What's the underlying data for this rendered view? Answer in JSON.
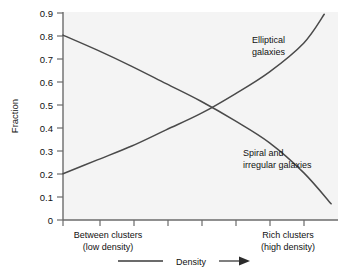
{
  "chart_data": {
    "type": "line",
    "title": "",
    "xlabel": "Density",
    "ylabel": "Fraction",
    "ylim": [
      0,
      0.9
    ],
    "xlim": [
      0,
      1
    ],
    "grid": false,
    "legend": "inline-annotations",
    "ytick_labels": [
      "0",
      "0.1",
      "0.2",
      "0.3",
      "0.4",
      "0.5",
      "0.6",
      "0.7",
      "0.8",
      "0.9"
    ],
    "ytick_values": [
      0,
      0.1,
      0.2,
      0.3,
      0.4,
      0.5,
      0.6,
      0.7,
      0.8,
      0.9
    ],
    "xtick_count": 8,
    "xtick_labels": [
      "",
      "",
      "",
      "",
      "",
      "",
      "",
      ""
    ],
    "x_category_left": "Between clusters",
    "x_category_left_sub": "(low density)",
    "x_category_right": "Rich clusters",
    "x_category_right_sub": "(high density)",
    "series": [
      {
        "name": "Elliptical galaxies",
        "label_line1": "Elliptical",
        "label_line2": "galaxies",
        "color": "#4a4a4a",
        "x": [
          0.0,
          0.125,
          0.25,
          0.375,
          0.5,
          0.625,
          0.75,
          0.875,
          0.95
        ],
        "values": [
          0.2,
          0.26,
          0.32,
          0.39,
          0.46,
          0.545,
          0.64,
          0.765,
          0.89
        ]
      },
      {
        "name": "Spiral and irregular galaxies",
        "label_line1": "Spiral and",
        "label_line2": "irregular galaxies",
        "color": "#4a4a4a",
        "x": [
          0.0,
          0.125,
          0.25,
          0.375,
          0.5,
          0.625,
          0.75,
          0.875,
          0.975
        ],
        "values": [
          0.8,
          0.735,
          0.665,
          0.59,
          0.515,
          0.43,
          0.335,
          0.205,
          0.07
        ]
      }
    ],
    "annotations": [
      {
        "text": "Density",
        "type": "axis-arrow",
        "direction": "right"
      }
    ]
  },
  "axes": {
    "y_axis_title": "Fraction",
    "x_axis_arrow_label": "Density"
  },
  "colors": {
    "curve": "#4a4a4a",
    "axis": "#6b6b6b",
    "plot_background": "#f4f4f4",
    "page_background": "#ffffff",
    "text": "#111111"
  }
}
